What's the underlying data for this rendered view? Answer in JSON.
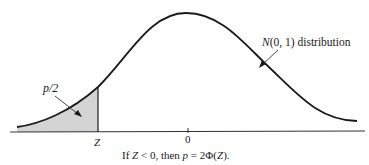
{
  "diagram": {
    "type": "normal-distribution-left-tail",
    "curve_label_italic": "N",
    "curve_label_rest": "(0, 1) distribution",
    "shaded_area_label": "p/2",
    "x_tick_z": "Z",
    "x_tick_zero": "0",
    "caption_parts": {
      "if": "If ",
      "z": "Z",
      "lt0": " < 0, then ",
      "p": "p",
      "eq": " = 2Φ(",
      "z2": "Z",
      "end": ")."
    },
    "colors": {
      "curve": "#1a1a1a",
      "shade": "#d4d4d4",
      "axis": "#333333"
    }
  }
}
